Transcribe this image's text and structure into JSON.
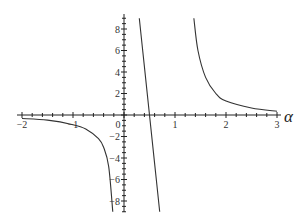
{
  "chart_data": {
    "type": "line",
    "title": "",
    "xlabel": "α",
    "ylabel": "",
    "xlim": [
      -2,
      3
    ],
    "ylim": [
      -9,
      9
    ],
    "grid": false,
    "legend": null,
    "x_ticks": [
      -2,
      -1,
      0,
      1,
      2,
      3
    ],
    "x_tick_labels": [
      "−2",
      "−1",
      "0",
      "1",
      "2",
      "3"
    ],
    "y_ticks": [
      -8,
      -6,
      -4,
      -2,
      2,
      4,
      6,
      8
    ],
    "y_tick_labels": [
      "−8",
      "−6",
      "−4",
      "−2",
      "2",
      "4",
      "6",
      "8"
    ],
    "series": [
      {
        "name": "branch-left",
        "x": [
          -2.0,
          -1.5,
          -1.0,
          -0.75,
          -0.5,
          -0.4,
          -0.3,
          -0.22
        ],
        "y": [
          -0.33,
          -0.48,
          -0.9,
          -1.3,
          -2.2,
          -3.0,
          -4.8,
          -9.0
        ]
      },
      {
        "name": "branch-middle",
        "x": [
          0.3,
          0.4,
          0.5,
          0.6,
          0.7
        ],
        "y": [
          9.0,
          4.5,
          0.0,
          -4.5,
          -9.0
        ]
      },
      {
        "name": "branch-right",
        "x": [
          1.37,
          1.45,
          1.6,
          1.8,
          2.0,
          2.5,
          3.0
        ],
        "y": [
          9.0,
          6.0,
          3.5,
          2.0,
          1.3,
          0.65,
          0.35
        ]
      }
    ],
    "annotations": []
  },
  "axes": {
    "x_label": "α",
    "origin_label": "0"
  }
}
